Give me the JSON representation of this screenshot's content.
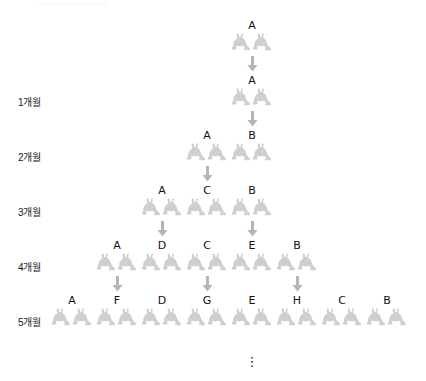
{
  "figure": {
    "title": "",
    "kind": "fibonacci-rabbit-breeding-tree",
    "ellipsis": "⋮"
  },
  "month_labels": [
    {
      "text": "1개월",
      "x": 18,
      "y": 97
    },
    {
      "text": "2개월",
      "x": 18,
      "y": 152
    },
    {
      "text": "3개월",
      "x": 18,
      "y": 207
    },
    {
      "text": "4개월",
      "x": 18,
      "y": 262
    },
    {
      "text": "5개월",
      "x": 18,
      "y": 317
    }
  ],
  "generations": [
    {
      "name": "start",
      "row_y": 20,
      "pairs": [
        {
          "label": "A",
          "x": 252
        }
      ]
    },
    {
      "name": "month-1",
      "row_y": 75,
      "pairs": [
        {
          "label": "A",
          "x": 252
        }
      ]
    },
    {
      "name": "month-2",
      "row_y": 130,
      "pairs": [
        {
          "label": "A",
          "x": 207
        },
        {
          "label": "B",
          "x": 252
        }
      ]
    },
    {
      "name": "month-3",
      "row_y": 185,
      "pairs": [
        {
          "label": "A",
          "x": 162
        },
        {
          "label": "C",
          "x": 207
        },
        {
          "label": "B",
          "x": 252
        }
      ]
    },
    {
      "name": "month-4",
      "row_y": 240,
      "pairs": [
        {
          "label": "A",
          "x": 117
        },
        {
          "label": "D",
          "x": 162
        },
        {
          "label": "C",
          "x": 207
        },
        {
          "label": "E",
          "x": 252
        },
        {
          "label": "B",
          "x": 297
        }
      ]
    },
    {
      "name": "month-5",
      "row_y": 295,
      "pairs": [
        {
          "label": "A",
          "x": 72
        },
        {
          "label": "F",
          "x": 117
        },
        {
          "label": "D",
          "x": 162
        },
        {
          "label": "G",
          "x": 207
        },
        {
          "label": "E",
          "x": 252
        },
        {
          "label": "H",
          "x": 297
        },
        {
          "label": "C",
          "x": 342
        },
        {
          "label": "B",
          "x": 387
        }
      ]
    }
  ],
  "arrows": [
    {
      "from": "A",
      "to": "A",
      "x": 252,
      "y": 56
    },
    {
      "from": "A",
      "to": "B",
      "x": 252,
      "y": 111
    },
    {
      "from": "A",
      "to": "C",
      "x": 207,
      "y": 166
    },
    {
      "from": "A",
      "to": "D",
      "x": 162,
      "y": 221
    },
    {
      "from": "B",
      "to": "E",
      "x": 252,
      "y": 221
    },
    {
      "from": "A",
      "to": "F",
      "x": 117,
      "y": 276
    },
    {
      "from": "C",
      "to": "G",
      "x": 207,
      "y": 276
    },
    {
      "from": "B",
      "to": "H",
      "x": 297,
      "y": 276
    }
  ],
  "ellipsis_marker": {
    "x": 252,
    "y": 355
  },
  "colors": {
    "rabbit_fill": "#cfcfcf",
    "arrow_fill": "#b5b5b5",
    "text": "#1a1a1a",
    "background": "#ffffff"
  },
  "chart_data": {
    "type": "diagram",
    "categories": [
      "start",
      "1개월",
      "2개월",
      "3개월",
      "4개월",
      "5개월"
    ],
    "values": [
      1,
      1,
      2,
      3,
      5,
      8
    ],
    "xlabel": "개월",
    "ylabel": "쌍 수",
    "series": [
      {
        "name": "pairs",
        "values": [
          1,
          1,
          2,
          3,
          5,
          8
        ]
      }
    ],
    "labels_per_row": [
      [
        "A"
      ],
      [
        "A"
      ],
      [
        "A",
        "B"
      ],
      [
        "A",
        "C",
        "B"
      ],
      [
        "A",
        "D",
        "C",
        "E",
        "B"
      ],
      [
        "A",
        "F",
        "D",
        "G",
        "E",
        "H",
        "C",
        "B"
      ]
    ]
  }
}
